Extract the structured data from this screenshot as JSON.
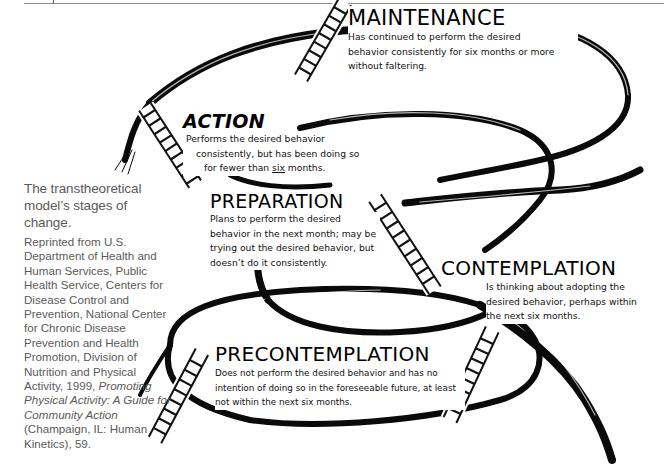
{
  "figure": {
    "caption_title": "The transtheoretical model’s stages of change.",
    "credit_parts": {
      "before_italic": "Reprinted from U.S. Department of Health and Human Services, Public Health Service, Centers for Disease Control and Prevention, National Center for Chronic Disease Prevention and Health Promotion, Division of Nutrition and Physical Activity, 1999, ",
      "italic": "Promoting Physical Activity: A Guide for Community Action",
      "after_italic": " (Champaign, IL: Human Kinetics), 59."
    }
  },
  "stages": {
    "maintenance": {
      "name": "MAINTENANCE",
      "description": "Has continued to perform the desired behavior consistently for six months or more without faltering."
    },
    "action": {
      "name": "ACTION",
      "description_lines": [
        "Performs the desired behavior",
        "consistently, but has been doing so",
        "for fewer than "
      ],
      "description_underlined": "six",
      "description_end": " months."
    },
    "preparation": {
      "name": "PREPARATION",
      "description": "Plans to perform the desired behavior in the next month;  may be trying out the desired behavior, but doesn’t do it consistently."
    },
    "contemplation": {
      "name": "CONTEMPLATION",
      "description": "Is thinking about adopting the desired behavior, perhaps within the next six months."
    },
    "precontemplation": {
      "name": "PRECONTEMPLATION",
      "description": "Does not perform the desired behavior and has no intention of doing so in the foreseeable future, at least not within the next six months."
    }
  },
  "diagram": {
    "path_color": "#0a0a0a",
    "ladder_color": "#111111",
    "ladder_count": 5
  }
}
